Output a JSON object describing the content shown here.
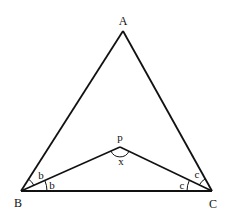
{
  "diagram": {
    "type": "triangle-with-interior-point",
    "stroke_color": "#111111",
    "background": "#ffffff",
    "vertices": {
      "A": {
        "label": "A",
        "x": 123,
        "y": 31
      },
      "B": {
        "label": "B",
        "x": 21,
        "y": 191
      },
      "C": {
        "label": "C",
        "x": 212,
        "y": 191
      },
      "P": {
        "label": "p",
        "x": 120,
        "y": 147
      }
    },
    "segments": [
      "AB",
      "AC",
      "BC",
      "BP",
      "CP"
    ],
    "angle_labels": {
      "B_upper": "b",
      "B_lower": "b",
      "C_upper": "c",
      "C_lower": "c",
      "P": "x"
    }
  }
}
